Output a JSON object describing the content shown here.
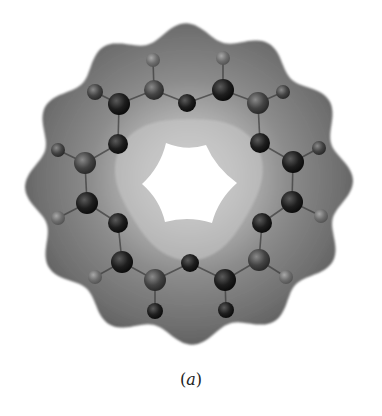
{
  "figure": {
    "caption_open": "(",
    "caption_letter": "a",
    "caption_close": ")",
    "colors": {
      "shell_dark": "#5e5e5e",
      "shell_mid": "#858585",
      "shell_light": "#c4c4c4",
      "atom_dark": "#1a1a1a",
      "atom_mid": "#4a4a4a",
      "atom_light": "#7c7c7c",
      "hole": "#ffffff"
    },
    "center": [
      189,
      184
    ],
    "hole_vertices": [
      [
        166,
        143
      ],
      [
        206,
        145
      ],
      [
        237,
        183
      ],
      [
        212,
        223
      ],
      [
        165,
        222
      ],
      [
        142,
        184
      ]
    ],
    "atoms": [
      {
        "x": 153,
        "y": 60,
        "r": 7,
        "tone": "light"
      },
      {
        "x": 154,
        "y": 90,
        "r": 10,
        "tone": "mid"
      },
      {
        "x": 187,
        "y": 103,
        "r": 9,
        "tone": "dark"
      },
      {
        "x": 95,
        "y": 92,
        "r": 8,
        "tone": "mid"
      },
      {
        "x": 119,
        "y": 104,
        "r": 11,
        "tone": "dark"
      },
      {
        "x": 118,
        "y": 144,
        "r": 10,
        "tone": "dark"
      },
      {
        "x": 58,
        "y": 150,
        "r": 7,
        "tone": "mid"
      },
      {
        "x": 85,
        "y": 163,
        "r": 11,
        "tone": "mid"
      },
      {
        "x": 223,
        "y": 58,
        "r": 7,
        "tone": "light"
      },
      {
        "x": 223,
        "y": 90,
        "r": 11,
        "tone": "dark"
      },
      {
        "x": 258,
        "y": 103,
        "r": 11,
        "tone": "mid"
      },
      {
        "x": 283,
        "y": 92,
        "r": 7,
        "tone": "mid"
      },
      {
        "x": 260,
        "y": 143,
        "r": 10,
        "tone": "dark"
      },
      {
        "x": 293,
        "y": 162,
        "r": 11,
        "tone": "dark"
      },
      {
        "x": 319,
        "y": 148,
        "r": 7,
        "tone": "mid"
      },
      {
        "x": 87,
        "y": 203,
        "r": 11,
        "tone": "dark"
      },
      {
        "x": 58,
        "y": 218,
        "r": 7,
        "tone": "light"
      },
      {
        "x": 118,
        "y": 223,
        "r": 10,
        "tone": "dark"
      },
      {
        "x": 122,
        "y": 262,
        "r": 11,
        "tone": "dark"
      },
      {
        "x": 95,
        "y": 277,
        "r": 7,
        "tone": "light"
      },
      {
        "x": 155,
        "y": 280,
        "r": 11,
        "tone": "mid"
      },
      {
        "x": 155,
        "y": 311,
        "r": 8,
        "tone": "dark"
      },
      {
        "x": 190,
        "y": 263,
        "r": 9,
        "tone": "dark"
      },
      {
        "x": 292,
        "y": 202,
        "r": 11,
        "tone": "dark"
      },
      {
        "x": 321,
        "y": 216,
        "r": 7,
        "tone": "light"
      },
      {
        "x": 262,
        "y": 223,
        "r": 10,
        "tone": "dark"
      },
      {
        "x": 259,
        "y": 260,
        "r": 11,
        "tone": "mid"
      },
      {
        "x": 286,
        "y": 277,
        "r": 7,
        "tone": "light"
      },
      {
        "x": 225,
        "y": 280,
        "r": 11,
        "tone": "dark"
      },
      {
        "x": 226,
        "y": 310,
        "r": 8,
        "tone": "dark"
      }
    ],
    "bonds": [
      [
        0,
        1
      ],
      [
        1,
        2
      ],
      [
        1,
        4
      ],
      [
        3,
        4
      ],
      [
        4,
        5
      ],
      [
        5,
        7
      ],
      [
        6,
        7
      ],
      [
        8,
        9
      ],
      [
        9,
        2
      ],
      [
        9,
        10
      ],
      [
        10,
        11
      ],
      [
        10,
        12
      ],
      [
        12,
        13
      ],
      [
        13,
        14
      ],
      [
        7,
        15
      ],
      [
        15,
        16
      ],
      [
        15,
        17
      ],
      [
        17,
        18
      ],
      [
        18,
        19
      ],
      [
        18,
        20
      ],
      [
        20,
        21
      ],
      [
        20,
        22
      ],
      [
        13,
        23
      ],
      [
        23,
        24
      ],
      [
        23,
        25
      ],
      [
        25,
        26
      ],
      [
        26,
        27
      ],
      [
        26,
        28
      ],
      [
        28,
        29
      ],
      [
        28,
        22
      ]
    ]
  }
}
